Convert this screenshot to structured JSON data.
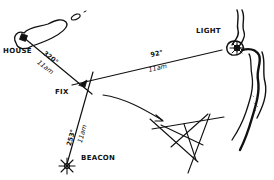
{
  "diagram": {
    "type": "navigation-three-point-fix",
    "ink_color": "#111111",
    "background_color": "#ffffff",
    "landmarks": {
      "house": {
        "label": "House"
      },
      "light": {
        "label": "Light"
      },
      "beacon": {
        "label": "Beacon"
      },
      "fix": {
        "label": "Fix"
      }
    },
    "bearings": {
      "house": {
        "degrees": "320°",
        "time": "11am"
      },
      "light": {
        "degrees": "92°",
        "time": "11am"
      },
      "beacon": {
        "degrees": "253°",
        "time": "11am"
      }
    },
    "inset": {
      "description": "cocked-hat triangle of crossing bearing lines"
    }
  }
}
